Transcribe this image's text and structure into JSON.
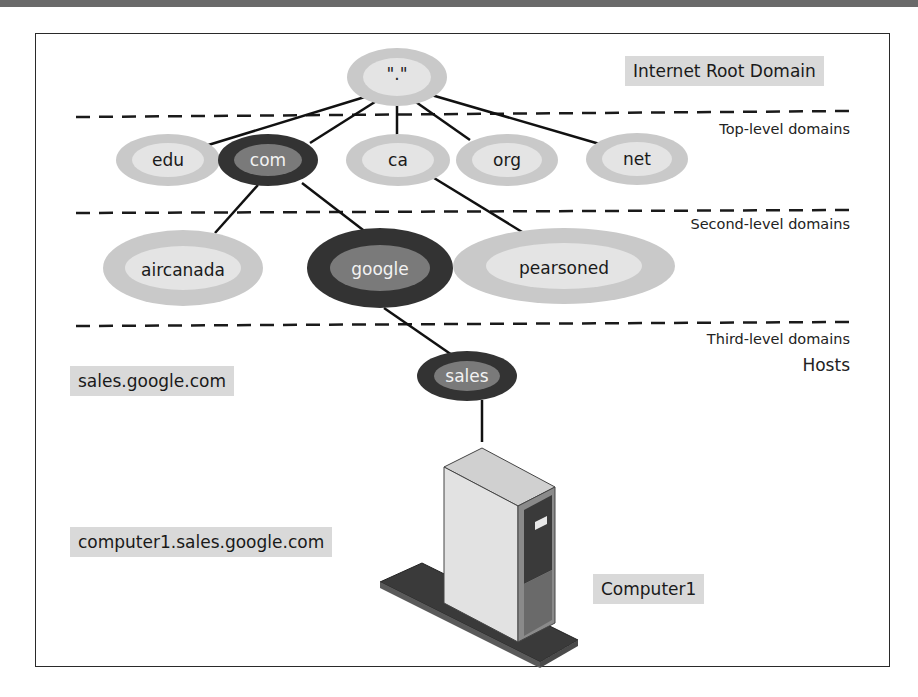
{
  "figure": {
    "title_tag": "Internet Root Domain",
    "root_node": {
      "label": "\".\""
    },
    "level_labels": {
      "top_level": "Top-level domains",
      "second_level": "Second-level domains",
      "third_level": "Third-level domains",
      "hosts": "Hosts"
    },
    "top_level_domains": [
      {
        "label": "edu",
        "highlighted": false
      },
      {
        "label": "com",
        "highlighted": true
      },
      {
        "label": "ca",
        "highlighted": false
      },
      {
        "label": "org",
        "highlighted": false
      },
      {
        "label": "net",
        "highlighted": false
      }
    ],
    "second_level_domains": [
      {
        "label": "aircanada",
        "parent": "com",
        "highlighted": false
      },
      {
        "label": "google",
        "parent": "com",
        "highlighted": true
      },
      {
        "label": "pearsoned",
        "parent": "ca",
        "highlighted": false
      }
    ],
    "third_level_domains": [
      {
        "label": "sales",
        "parent": "google",
        "highlighted": true
      }
    ],
    "fqdn_tags": {
      "sales": "sales.google.com",
      "computer": "computer1.sales.google.com"
    },
    "host": {
      "label": "Computer1",
      "icon": "server-tower-icon"
    },
    "colors": {
      "light_outer": "#c8c8c8",
      "light_inner": "#e4e4e4",
      "dark_outer": "#333333",
      "dark_inner": "#7a7a7a",
      "tag_bg": "#d9d9d9"
    }
  }
}
